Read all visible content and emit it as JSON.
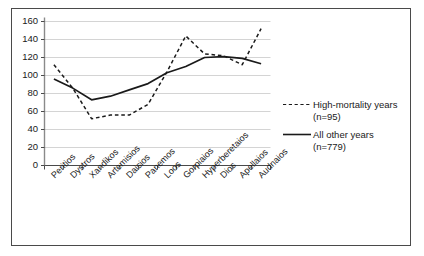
{
  "chart_data": {
    "type": "line",
    "title": "",
    "xlabel": "",
    "ylabel": "",
    "ylim": [
      0,
      160
    ],
    "ytick_step": 20,
    "grid": true,
    "legend_position": "right",
    "categories": [
      "Peritios",
      "Dystros",
      "Xandikos",
      "Artemisios",
      "Daisios",
      "Panemos",
      "Loos",
      "Gorpiaios",
      "Hyperberetaios",
      "Dios",
      "Apellaios",
      "Audnaios"
    ],
    "ytick_labels": [
      "0",
      "20",
      "40",
      "60",
      "80",
      "100",
      "120",
      "140",
      "160"
    ],
    "series": [
      {
        "name": "High-mortality years",
        "count_label": "(n=95)",
        "style": "dashed",
        "color": "#1a1a1a",
        "values": [
          112,
          86,
          52,
          56,
          56,
          68,
          104,
          144,
          124,
          122,
          112,
          152
        ]
      },
      {
        "name": "All other years",
        "count_label": "(n=779)",
        "style": "solid",
        "color": "#1a1a1a",
        "values": [
          96,
          86,
          73,
          77,
          84,
          91,
          103,
          110,
          120,
          121,
          119,
          113
        ]
      }
    ]
  },
  "legend": {
    "items": [
      {
        "label": "High-mortality years",
        "sublabel": "(n=95)",
        "marker": "dashed-line-marker"
      },
      {
        "label": "All other years",
        "sublabel": "(n=779)",
        "marker": "solid-line-marker"
      }
    ]
  }
}
